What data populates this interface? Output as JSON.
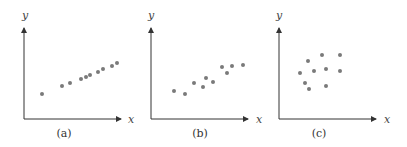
{
  "chart_data": [
    {
      "type": "scatter",
      "caption": "(a)",
      "xlabel": "x",
      "ylabel": "y",
      "grid": false,
      "description": "strong positive linear relationship",
      "points_px": [
        [
          42,
          94
        ],
        [
          62,
          86
        ],
        [
          70,
          83
        ],
        [
          81,
          79
        ],
        [
          86,
          77
        ],
        [
          90,
          75
        ],
        [
          98,
          72
        ],
        [
          103,
          69
        ],
        [
          112,
          66
        ],
        [
          117,
          63
        ]
      ],
      "x": [
        1.8,
        3.8,
        4.6,
        5.7,
        6.2,
        6.6,
        7.4,
        7.9,
        8.8,
        9.3
      ],
      "y": [
        2.5,
        3.3,
        3.6,
        4.0,
        4.2,
        4.4,
        4.7,
        5.0,
        5.3,
        5.6
      ]
    },
    {
      "type": "scatter",
      "caption": "(b)",
      "xlabel": "x",
      "ylabel": "y",
      "grid": false,
      "description": "moderate positive relationship",
      "points_px": [
        [
          174,
          91
        ],
        [
          185,
          94
        ],
        [
          194,
          83
        ],
        [
          203,
          87
        ],
        [
          206,
          78
        ],
        [
          213,
          82
        ],
        [
          222,
          67
        ],
        [
          227,
          73
        ],
        [
          232,
          66
        ],
        [
          243,
          65
        ]
      ],
      "x": [
        2.3,
        3.4,
        4.3,
        5.2,
        5.5,
        6.2,
        7.1,
        7.6,
        8.1,
        9.2
      ],
      "y": [
        2.8,
        2.5,
        3.6,
        3.2,
        4.1,
        3.7,
        5.2,
        4.6,
        5.3,
        5.4
      ]
    },
    {
      "type": "scatter",
      "caption": "(c)",
      "xlabel": "x",
      "ylabel": "y",
      "grid": false,
      "description": "no apparent relationship",
      "points_px": [
        [
          300,
          73
        ],
        [
          308,
          61
        ],
        [
          305,
          83
        ],
        [
          309,
          89
        ],
        [
          314,
          71
        ],
        [
          322,
          55
        ],
        [
          326,
          69
        ],
        [
          326,
          86
        ],
        [
          340,
          55
        ],
        [
          340,
          71
        ]
      ],
      "x": [
        2.1,
        2.9,
        2.6,
        3.0,
        3.5,
        4.3,
        4.7,
        4.7,
        6.1,
        6.1
      ],
      "y": [
        4.6,
        5.8,
        3.6,
        3.0,
        4.8,
        6.4,
        5.0,
        3.3,
        6.4,
        4.8
      ]
    }
  ],
  "panels": [
    {
      "caption": "(a)",
      "xlabel": "x",
      "ylabel": "y"
    },
    {
      "caption": "(b)",
      "xlabel": "x",
      "ylabel": "y"
    },
    {
      "caption": "(c)",
      "xlabel": "x",
      "ylabel": "y"
    }
  ],
  "colors": {
    "axis": "#333333",
    "point": "#7a7a7a",
    "text": "#444444"
  }
}
